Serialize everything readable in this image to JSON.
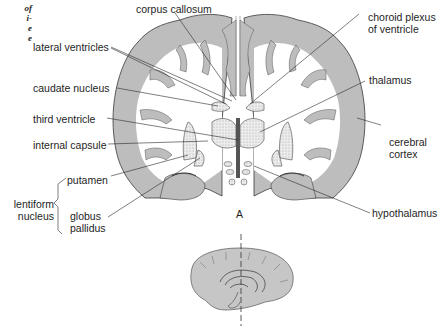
{
  "caption_fragment": {
    "lines": [
      "of",
      "i-",
      "e",
      "e"
    ]
  },
  "diagram": {
    "title_letter": "A",
    "labels": {
      "corpus_callosum": "corpus callosum",
      "lateral_ventricles": "lateral ventricles",
      "caudate_nucleus": "caudate nucleus",
      "third_ventricle": "third ventricle",
      "internal_capsule": "internal capsule",
      "putamen": "putamen",
      "lentiform_1": "lentiform",
      "lentiform_2": "nucleus",
      "globus_1": "globus",
      "globus_2": "pallidus",
      "choroid_1": "choroid plexus",
      "choroid_2": "of  ventricle",
      "thalamus": "thalamus",
      "cerebral_1": "cerebral",
      "cerebral_2": "cortex",
      "hypothalamus": "hypothalamus"
    },
    "colors": {
      "gray_matter": "#bdbdbd",
      "white_matter": "#ffffff",
      "outline": "#3a3a3a",
      "stipple": "#d6d6d6"
    }
  }
}
